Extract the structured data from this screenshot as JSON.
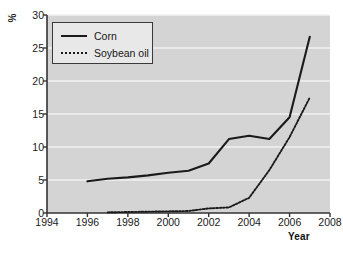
{
  "chart_data": {
    "type": "line",
    "title": "",
    "subtitle": "",
    "xlabel": "Year",
    "ylabel": "%",
    "xlim": [
      1994,
      2008
    ],
    "ylim": [
      0,
      30
    ],
    "xticks": [
      "1994",
      "1996",
      "1998",
      "2000",
      "2002",
      "2004",
      "2006",
      "2008"
    ],
    "yticks": [
      "0",
      "5",
      "10",
      "15",
      "20",
      "25",
      "30"
    ],
    "grid": "horizontal",
    "legend_position": "top-left-inside",
    "series": [
      {
        "name": "Corn",
        "style": "solid",
        "color": "#1a1a1a",
        "x": [
          1996,
          1997,
          1998,
          1999,
          2000,
          2001,
          2002,
          2003,
          2004,
          2005,
          2006,
          2007
        ],
        "values": [
          4.8,
          5.2,
          5.4,
          5.7,
          6.1,
          6.4,
          7.5,
          11.2,
          11.7,
          11.2,
          14.5,
          26.7
        ]
      },
      {
        "name": "Soybean oil",
        "style": "dotted",
        "color": "#1a1a1a",
        "x": [
          1997,
          1998,
          1999,
          2000,
          2001,
          2002,
          2003,
          2004,
          2005,
          2006,
          2007
        ],
        "values": [
          0.1,
          0.15,
          0.2,
          0.25,
          0.3,
          0.7,
          0.85,
          2.3,
          6.5,
          11.5,
          17.5
        ]
      }
    ]
  },
  "legend": {
    "items": [
      {
        "label": "Corn"
      },
      {
        "label": "Soybean oil"
      }
    ]
  },
  "colors": {
    "plot_background": "#d4d4d4",
    "gridline": "#f2f2f2",
    "axis": "#333333",
    "line": "#1a1a1a",
    "page_background": "#ffffff"
  }
}
